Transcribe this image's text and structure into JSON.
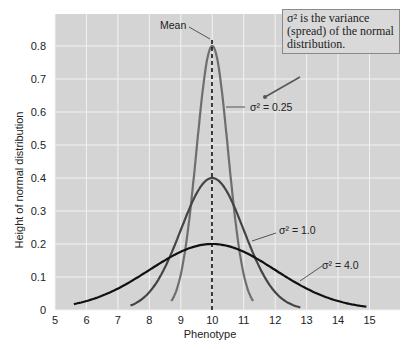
{
  "chart_data": {
    "type": "line",
    "title": "",
    "xlabel": "Phenotype",
    "ylabel": "Height of normal distribution",
    "xlim": [
      5,
      15
    ],
    "ylim": [
      0,
      0.85
    ],
    "xticks": [
      "5",
      "6",
      "7",
      "8",
      "9",
      "10",
      "11",
      "12",
      "13",
      "14",
      "15"
    ],
    "yticks": [
      "0",
      "0.1",
      "0.2",
      "0.3",
      "0.4",
      "0.5",
      "0.6",
      "0.7",
      "0.8"
    ],
    "grid": true,
    "mean": 10,
    "series": [
      {
        "name": "σ² = 0.25",
        "variance": 0.25,
        "mean": 10,
        "peak": 0.8,
        "color": "#6e6e6e",
        "x_range": [
          8.7,
          11.3
        ]
      },
      {
        "name": "σ² = 1.0",
        "variance": 1.0,
        "mean": 10,
        "peak": 0.4,
        "color": "#444444",
        "x_range": [
          7.4,
          12.8
        ]
      },
      {
        "name": "σ² = 4.0",
        "variance": 4.0,
        "mean": 10,
        "peak": 0.2,
        "color": "#111111",
        "x_range": [
          5.6,
          14.9
        ]
      }
    ],
    "annotations": [
      {
        "text": "Mean",
        "target": "peak of mean line at x=10"
      },
      {
        "text": "σ² is the variance (spread) of the normal distribution.",
        "type": "callout"
      },
      {
        "text": "σ² = 0.25"
      },
      {
        "text": "σ² = 1.0"
      },
      {
        "text": "σ² = 4.0"
      }
    ]
  },
  "labels": {
    "mean": "Mean",
    "callout": "σ² is the variance (spread) of the normal distribution.",
    "s025": "σ² = 0.25",
    "s1": "σ² = 1.0",
    "s4": "σ² = 4.0",
    "xlabel": "Phenotype",
    "ylabel": "Height of normal distribution"
  },
  "colors": {
    "plot_bg": "#d4d4d4",
    "grid": "#f2f2f2"
  }
}
